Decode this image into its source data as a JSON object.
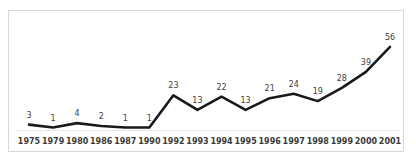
{
  "chart_data": {
    "type": "line",
    "title": "",
    "subtitle": "",
    "xlabel": "",
    "ylabel": "",
    "categories": [
      "1975",
      "1979",
      "1980",
      "1986",
      "1987",
      "1990",
      "1992",
      "1993",
      "1994",
      "1995",
      "1996",
      "1997",
      "1998",
      "1999",
      "2000",
      "2001"
    ],
    "values": [
      3,
      1,
      4,
      2,
      1,
      1,
      23,
      13,
      22,
      13,
      21,
      24,
      19,
      28,
      39,
      56
    ],
    "series": [
      {
        "name": "",
        "values": [
          3,
          1,
          4,
          2,
          1,
          1,
          23,
          13,
          22,
          13,
          21,
          24,
          19,
          28,
          39,
          56
        ]
      }
    ],
    "data_labels": [
      "3",
      "1",
      "4",
      "2",
      "1",
      "1",
      "23",
      "13",
      "22",
      "13",
      "21",
      "24",
      "19",
      "28",
      "39",
      "56"
    ],
    "ylim": [
      0,
      60
    ],
    "xlim": [
      0,
      15
    ],
    "grid": false,
    "legend": false,
    "legend_position": "none",
    "show_markers": false,
    "show_data_labels": true,
    "colors": {
      "line": "#1a1a1a",
      "data_label": "#404040",
      "tick_label": "#3a3a3a",
      "frame_border": "#d8d8d8",
      "axis_line": "#e6e6e6",
      "background": "#ffffff"
    },
    "line_width": 2.6
  }
}
